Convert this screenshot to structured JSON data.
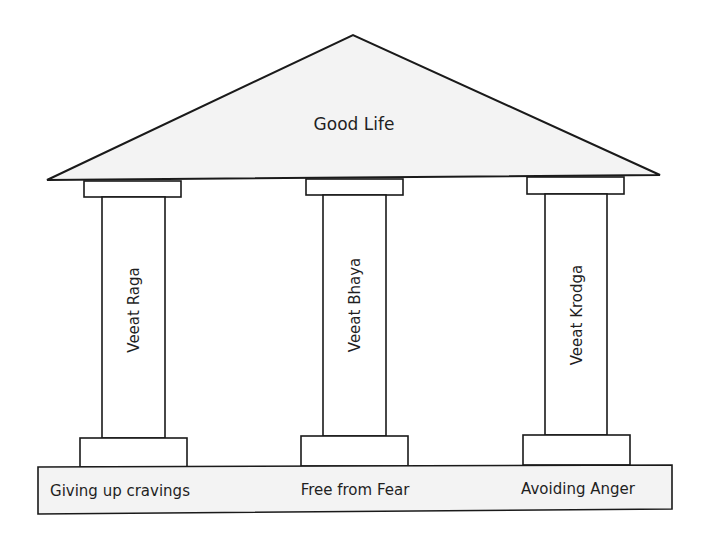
{
  "diagram": {
    "type": "temple-pillars",
    "roof": {
      "label": "Good Life",
      "fill": "#f3f3f3"
    },
    "pillars": [
      {
        "label": "Veeat Raga",
        "base_label": "Giving up cravings"
      },
      {
        "label": "Veeat Bhaya",
        "base_label": "Free from Fear"
      },
      {
        "label": "Veeat Krodga",
        "base_label": "Avoiding Anger"
      }
    ],
    "foundation": {
      "fill": "#f3f3f3"
    },
    "colors": {
      "stroke": "#1a1a1a",
      "text": "#1f1f1f",
      "pillar_fill": "#ffffff"
    }
  }
}
